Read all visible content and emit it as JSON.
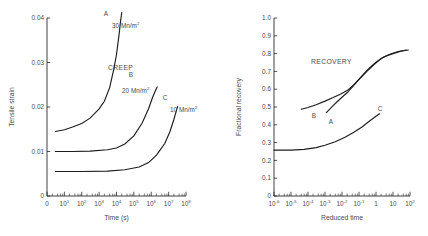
{
  "figure": {
    "background_color": "#ffffff",
    "ink_color": "#1d1d1d",
    "text_color": "#4a4a4a"
  },
  "chart_data": [
    {
      "id": "creep",
      "type": "line",
      "title": "CREEP",
      "xlabel": "Time (s)",
      "ylabel": "Tensile strain",
      "xscale": "log",
      "yscale": "linear",
      "xlim": [
        1,
        100000000
      ],
      "ylim": [
        0,
        0.04
      ],
      "grid": false,
      "legend_position": "inline-annotations",
      "xtick_labels": [
        "0",
        "10",
        "10",
        "10",
        "10",
        "10",
        "10",
        "10",
        "10"
      ],
      "xtick_exponents": [
        "",
        "1",
        "2",
        "3",
        "4",
        "5",
        "6",
        "7",
        "8"
      ],
      "ytick_labels": [
        "0",
        "0.01",
        "0.02",
        "0.03",
        "0.04"
      ],
      "ytick_values": [
        0,
        0.01,
        0.02,
        0.03,
        0.04
      ],
      "series": [
        {
          "name": "A",
          "annotation": "30 Mn/m",
          "annotation_exponent": "2",
          "x": [
            3,
            10,
            30,
            100,
            300,
            1000,
            2000,
            4000,
            7000,
            10000,
            14000,
            17000,
            19000,
            20000
          ],
          "y": [
            0.0145,
            0.0149,
            0.0155,
            0.0163,
            0.0175,
            0.0196,
            0.0213,
            0.0243,
            0.0285,
            0.0318,
            0.0362,
            0.0392,
            0.0405,
            0.0412
          ]
        },
        {
          "name": "B",
          "annotation": "20 Mn/m",
          "annotation_exponent": "2",
          "x": [
            3,
            30,
            300,
            3000,
            10000,
            30000,
            100000,
            300000,
            700000,
            1200000,
            1800000,
            2200000
          ],
          "y": [
            0.01,
            0.01,
            0.0101,
            0.0104,
            0.0108,
            0.0117,
            0.0135,
            0.0164,
            0.0196,
            0.0222,
            0.0238,
            0.0245
          ]
        },
        {
          "name": "C",
          "annotation": "10 Mn/m",
          "annotation_exponent": "2",
          "x": [
            3,
            100,
            3000,
            30000,
            200000,
            700000,
            2000000,
            6000000,
            12000000,
            20000000,
            28000000,
            33000000
          ],
          "y": [
            0.0055,
            0.0055,
            0.0056,
            0.0059,
            0.0065,
            0.0075,
            0.0092,
            0.0118,
            0.0145,
            0.0172,
            0.0192,
            0.0201
          ]
        }
      ]
    },
    {
      "id": "recovery",
      "type": "line",
      "title": "RECOVERY",
      "xlabel": "Reduced time",
      "ylabel": "Fractional recovery",
      "xscale": "log",
      "yscale": "linear",
      "xlim": [
        1e-06,
        100
      ],
      "ylim": [
        0,
        1.0
      ],
      "grid": false,
      "legend_position": "inline-annotations",
      "xtick_labels": [
        "10",
        "10",
        "10",
        "10",
        "10",
        "10",
        "1",
        "10",
        "10"
      ],
      "xtick_exponents": [
        "-6",
        "-5",
        "-4",
        "-3",
        "-2",
        "-1",
        "",
        "",
        "2"
      ],
      "ytick_labels": [
        "0",
        "0.1",
        "0.2",
        "0.3",
        "0.4",
        "0.5",
        "0.6",
        "0.7",
        "0.8",
        "0.9",
        "1.0"
      ],
      "ytick_values": [
        0,
        0.1,
        0.2,
        0.3,
        0.4,
        0.5,
        0.6,
        0.7,
        0.8,
        0.9,
        1.0
      ],
      "series": [
        {
          "name": "B",
          "x": [
            4e-05,
            0.0001,
            0.0003,
            0.001,
            0.003,
            0.008,
            0.02,
            0.05,
            0.12,
            0.3,
            0.8,
            2,
            6,
            20,
            60
          ],
          "y": [
            0.487,
            0.497,
            0.513,
            0.533,
            0.553,
            0.572,
            0.592,
            0.625,
            0.663,
            0.702,
            0.74,
            0.772,
            0.795,
            0.812,
            0.82
          ]
        },
        {
          "name": "A",
          "x": [
            0.0012,
            0.003,
            0.006,
            0.012,
            0.02,
            0.04,
            0.08,
            0.18,
            0.4,
            1.0,
            3,
            10,
            30,
            80
          ],
          "y": [
            0.468,
            0.508,
            0.535,
            0.562,
            0.58,
            0.612,
            0.645,
            0.683,
            0.718,
            0.752,
            0.782,
            0.8,
            0.813,
            0.82
          ]
        },
        {
          "name": "C",
          "x": [
            1e-06,
            1e-05,
            6e-05,
            0.0003,
            0.001,
            0.004,
            0.015,
            0.05,
            0.15,
            0.4,
            1.0,
            1.6
          ],
          "y": [
            0.258,
            0.258,
            0.262,
            0.272,
            0.285,
            0.305,
            0.33,
            0.358,
            0.388,
            0.42,
            0.448,
            0.462
          ]
        }
      ]
    }
  ]
}
